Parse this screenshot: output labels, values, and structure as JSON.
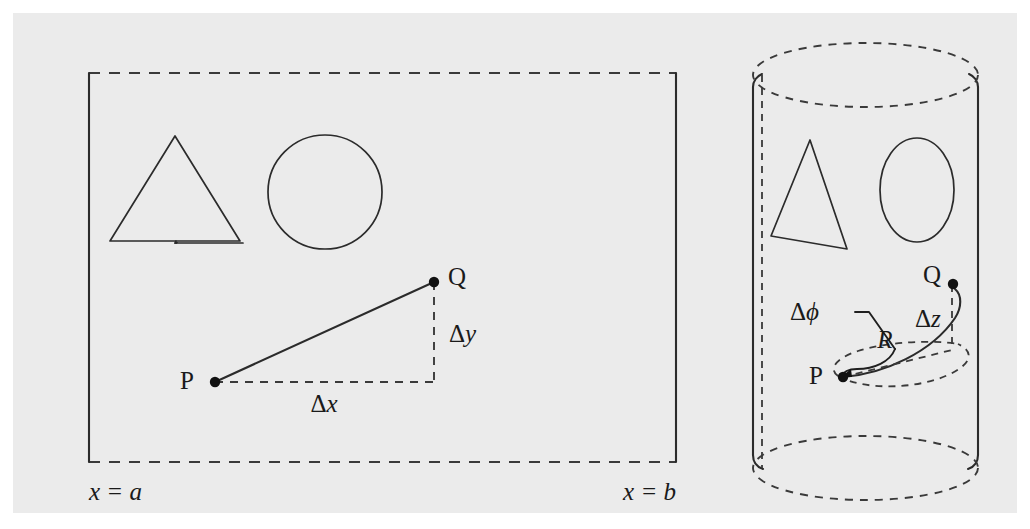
{
  "figure": {
    "background_color": "#ebebeb",
    "ink_color": "#2b2b2b",
    "page_color": "#ffffff"
  },
  "left_panel": {
    "name": "flat-cartesian-domain",
    "boundary_labels": {
      "left": "x = a",
      "right": "x = b"
    },
    "points": {
      "p_label": "P",
      "q_label": "Q"
    },
    "displacement_labels": {
      "horizontal": "Δx",
      "vertical": "Δy"
    },
    "shapes": [
      {
        "name": "triangle",
        "kind": "triangle"
      },
      {
        "name": "circle",
        "kind": "circle"
      }
    ],
    "edges": {
      "top": "dashed",
      "bottom": "dashed",
      "left": "solid",
      "right": "solid"
    }
  },
  "right_panel": {
    "name": "cylindrical-surface",
    "points": {
      "p_label": "P",
      "q_label": "Q"
    },
    "displacement_labels": {
      "angular": "Δϕ",
      "axial": "Δz",
      "radius": "R"
    },
    "shapes": [
      {
        "name": "triangle-distorted",
        "kind": "triangle"
      },
      {
        "name": "ellipse-distorted",
        "kind": "ellipse"
      }
    ],
    "edges": {
      "top_rim": "dashed",
      "bottom_rim": "dashed",
      "left_side": "solid",
      "right_side": "solid",
      "seam": "dashed"
    }
  },
  "symbols": {
    "delta": "Δ",
    "phi": "ϕ",
    "x_var": "x",
    "y_var": "y",
    "z_var": "z",
    "r_var": "R",
    "a_var": "a",
    "b_var": "b",
    "equals": "="
  }
}
